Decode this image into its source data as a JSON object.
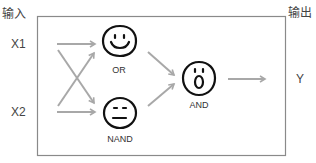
{
  "labels": {
    "input_header": "输入",
    "output_header": "输出",
    "x1": "X1",
    "x2": "X2",
    "y": "Y"
  },
  "gates": [
    {
      "name": "OR",
      "face": "smile"
    },
    {
      "name": "NAND",
      "face": "neutral"
    },
    {
      "name": "AND",
      "face": "surprised"
    }
  ],
  "colors": {
    "arrow": "#a8a8a8",
    "box": "#888888",
    "face": "#111111"
  }
}
